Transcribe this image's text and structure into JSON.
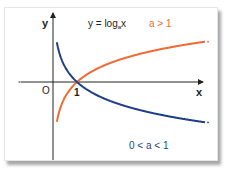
{
  "chart_data": {
    "type": "line",
    "title_main": "y = log",
    "title_sub": "a",
    "title_tail": "x",
    "xlabel": "x",
    "ylabel": "y",
    "origin_label": "O",
    "intersection_label": "1",
    "grid": false,
    "series": [
      {
        "name": "a > 1",
        "label": "a > 1",
        "color": "#f06a35",
        "base": 3.0
      },
      {
        "name": "0 < a < 1",
        "label": "0 < a < 1",
        "color": "#1e3f8a",
        "base": 0.333
      }
    ],
    "xlim": [
      0,
      6.3
    ],
    "ylim": [
      -3.5,
      2.7
    ]
  }
}
